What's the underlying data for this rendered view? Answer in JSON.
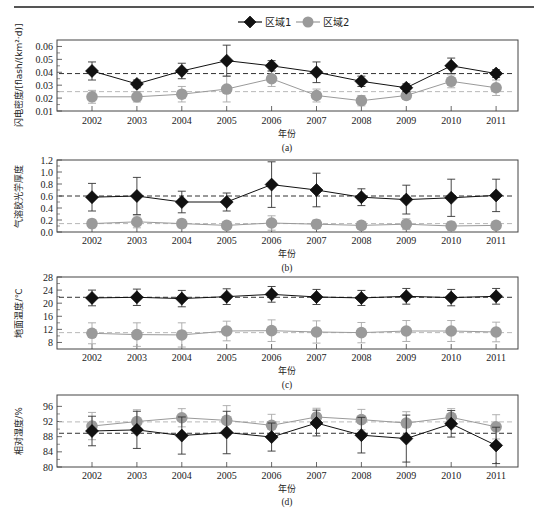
{
  "legend": {
    "series": [
      {
        "name": "区域1",
        "marker": "diamond",
        "color": "#111111"
      },
      {
        "name": "区域2",
        "marker": "circle",
        "color": "#9a9a9a"
      }
    ]
  },
  "chart_data": [
    {
      "type": "line",
      "panel": "(a)",
      "caption": "(a)",
      "title": "",
      "xlabel": "年份",
      "ylabel": "闪电密度/[flash/(km²·d)]",
      "categories": [
        "2002",
        "2003",
        "2004",
        "2005",
        "2006",
        "2007",
        "2008",
        "2009",
        "2010",
        "2011"
      ],
      "ylim": [
        0.01,
        0.065
      ],
      "yticks": [
        0.01,
        0.02,
        0.03,
        0.04,
        0.05,
        0.06
      ],
      "ytick_labels": [
        "0.01",
        "0.02",
        "0.03",
        "0.04",
        "0.05",
        "0.06"
      ],
      "series": [
        {
          "name": "区域1",
          "values": [
            0.041,
            0.031,
            0.041,
            0.049,
            0.045,
            0.04,
            0.033,
            0.028,
            0.045,
            0.039
          ],
          "err": [
            0.007,
            0.003,
            0.006,
            0.012,
            0.004,
            0.008,
            0.004,
            0.003,
            0.006,
            0.003
          ],
          "mean_line": 0.039
        },
        {
          "name": "区域2",
          "values": [
            0.021,
            0.021,
            0.023,
            0.027,
            0.035,
            0.022,
            0.018,
            0.022,
            0.033,
            0.028
          ],
          "err": [
            0.005,
            0.004,
            0.006,
            0.01,
            0.006,
            0.005,
            0.004,
            0.003,
            0.005,
            0.006
          ],
          "mean_line": 0.025
        }
      ],
      "grid": false,
      "legend_position": "top-center"
    },
    {
      "type": "line",
      "panel": "(b)",
      "caption": "(b)",
      "xlabel": "年份",
      "ylabel": "气溶胶光学厚度",
      "categories": [
        "2002",
        "2003",
        "2004",
        "2005",
        "2006",
        "2007",
        "2008",
        "2009",
        "2010",
        "2011"
      ],
      "ylim": [
        0.0,
        1.2
      ],
      "yticks": [
        0.0,
        0.2,
        0.4,
        0.6,
        0.8,
        1.0,
        1.2
      ],
      "ytick_labels": [
        "0.0",
        "0.2",
        "0.4",
        "0.6",
        "0.8",
        "1.0",
        "1.2"
      ],
      "series": [
        {
          "name": "区域1",
          "values": [
            0.58,
            0.6,
            0.5,
            0.5,
            0.79,
            0.7,
            0.58,
            0.54,
            0.57,
            0.61
          ],
          "err": [
            0.23,
            0.31,
            0.18,
            0.15,
            0.38,
            0.28,
            0.14,
            0.24,
            0.31,
            0.27
          ],
          "mean_line": 0.6
        },
        {
          "name": "区域2",
          "values": [
            0.14,
            0.17,
            0.14,
            0.11,
            0.15,
            0.13,
            0.11,
            0.13,
            0.1,
            0.11
          ],
          "err": [
            0.07,
            0.1,
            0.07,
            0.06,
            0.12,
            0.07,
            0.06,
            0.09,
            0.07,
            0.06
          ],
          "mean_line": 0.14
        }
      ]
    },
    {
      "type": "line",
      "panel": "(c)",
      "caption": "(c)",
      "xlabel": "年份",
      "ylabel": "地面温度/℃",
      "categories": [
        "2002",
        "2003",
        "2004",
        "2005",
        "2006",
        "2007",
        "2008",
        "2009",
        "2010",
        "2011"
      ],
      "ylim": [
        6,
        28
      ],
      "yticks": [
        8,
        12,
        16,
        20,
        24,
        28
      ],
      "ytick_labels": [
        "8",
        "12",
        "16",
        "20",
        "24",
        "28"
      ],
      "series": [
        {
          "name": "区域1",
          "values": [
            21.6,
            21.8,
            21.4,
            22.0,
            22.7,
            21.9,
            21.6,
            22.1,
            21.7,
            22.1
          ],
          "err": [
            2.4,
            2.5,
            2.5,
            2.4,
            2.4,
            2.3,
            2.3,
            2.4,
            2.5,
            2.4
          ],
          "mean_line": 21.8
        },
        {
          "name": "区域2",
          "values": [
            10.8,
            10.4,
            10.3,
            11.5,
            11.6,
            11.2,
            11.0,
            11.5,
            11.5,
            11.2
          ],
          "err": [
            3.2,
            3.6,
            3.7,
            3.0,
            3.3,
            3.4,
            3.1,
            3.2,
            3.2,
            3.0
          ],
          "mean_line": 11.0
        }
      ]
    },
    {
      "type": "line",
      "panel": "(d)",
      "caption": "(d)",
      "xlabel": "年份",
      "ylabel": "相对湿度/%",
      "categories": [
        "2002",
        "2003",
        "2004",
        "2005",
        "2006",
        "2007",
        "2008",
        "2009",
        "2010",
        "2011"
      ],
      "ylim": [
        80,
        99
      ],
      "yticks": [
        80,
        84,
        88,
        92,
        96
      ],
      "ytick_labels": [
        "80",
        "84",
        "88",
        "92",
        "96"
      ],
      "series": [
        {
          "name": "区域1",
          "values": [
            89.5,
            89.8,
            88.3,
            89.1,
            87.9,
            91.6,
            88.4,
            87.5,
            91.4,
            85.7
          ],
          "err": [
            3.9,
            4.9,
            4.9,
            5.6,
            3.7,
            3.4,
            4.7,
            6.2,
            3.5,
            4.8
          ],
          "mean_line": 88.9
        },
        {
          "name": "区域2",
          "values": [
            90.8,
            92.0,
            93.0,
            92.3,
            91.0,
            93.2,
            92.5,
            91.6,
            93.1,
            90.6
          ],
          "err": [
            3.6,
            3.1,
            2.4,
            3.9,
            2.9,
            2.3,
            2.7,
            3.0,
            2.3,
            3.2
          ],
          "mean_line": 91.9
        }
      ]
    }
  ]
}
